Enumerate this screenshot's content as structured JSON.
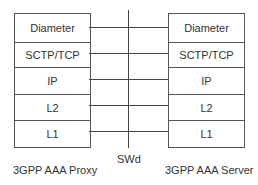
{
  "diagram": {
    "left_node": {
      "name": "3GPP AAA Proxy",
      "layers": [
        "Diameter",
        "SCTP/TCP",
        "IP",
        "L2",
        "L1"
      ]
    },
    "right_node": {
      "name": "3GPP AAA Server",
      "layers": [
        "Diameter",
        "SCTP/TCP",
        "IP",
        "L2",
        "L1"
      ]
    },
    "reference_point": "SWd",
    "colors": {
      "line": "#444444",
      "border": "#555555",
      "text": "#333333"
    }
  }
}
